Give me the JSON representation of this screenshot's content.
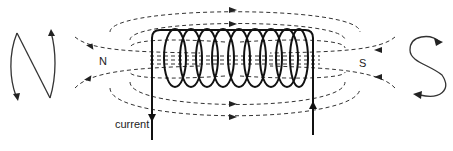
{
  "diagram": {
    "labels": {
      "north_pole": "N",
      "south_pole": "S",
      "current": "current"
    },
    "coil": {
      "turns": 9
    },
    "colors": {
      "wire": "#111111",
      "field_line": "#333333",
      "background": "#ffffff"
    },
    "symbols": {
      "left": "N-shaped current-direction symbol (anticlockwise view)",
      "right": "S-shaped current-direction symbol (clockwise view)"
    }
  }
}
